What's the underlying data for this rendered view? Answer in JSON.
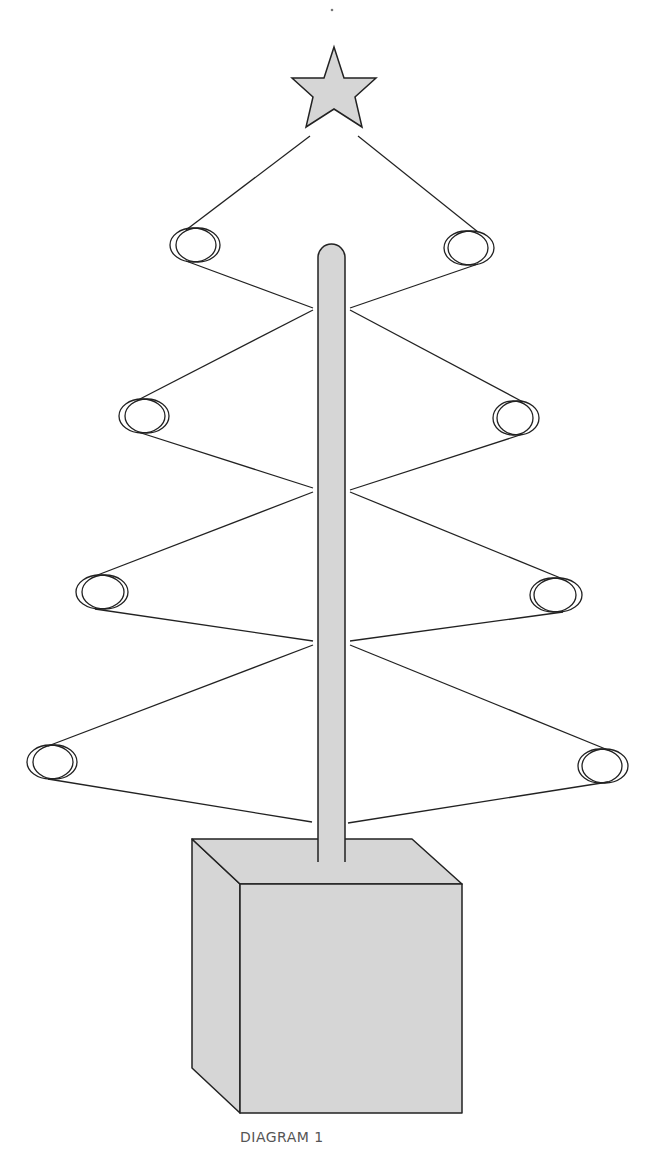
{
  "caption": "DIAGRAM 1",
  "colors": {
    "fill": "#d6d6d6",
    "stroke": "#222222",
    "caption": "#555555",
    "background": "#ffffff"
  },
  "star": {
    "points": [
      [
        334,
        47
      ],
      [
        344,
        78
      ],
      [
        376,
        78
      ],
      [
        355,
        97
      ],
      [
        362,
        127
      ],
      [
        334,
        109
      ],
      [
        306,
        127
      ],
      [
        313,
        97
      ],
      [
        292,
        78
      ],
      [
        324,
        78
      ]
    ]
  },
  "pole": {
    "x": 318,
    "y": 244,
    "width": 27,
    "bottom": 862,
    "radius": 13
  },
  "box": {
    "top_face": [
      [
        192,
        839
      ],
      [
        412,
        839
      ],
      [
        462,
        884
      ],
      [
        240,
        884
      ]
    ],
    "front_face": [
      [
        240,
        884
      ],
      [
        462,
        884
      ],
      [
        462,
        1113
      ],
      [
        240,
        1113
      ]
    ],
    "side_face": [
      [
        192,
        839
      ],
      [
        240,
        884
      ],
      [
        240,
        1113
      ],
      [
        192,
        1068
      ]
    ]
  },
  "rings": [
    {
      "side": "left",
      "cx": 198,
      "cy": 245,
      "rx": 22,
      "ry": 17,
      "tier": 1
    },
    {
      "side": "right",
      "cx": 466,
      "cy": 248,
      "rx": 22,
      "ry": 17,
      "tier": 1
    },
    {
      "side": "left",
      "cx": 147,
      "cy": 416,
      "rx": 22,
      "ry": 17,
      "tier": 2
    },
    {
      "side": "right",
      "cx": 513,
      "cy": 418,
      "rx": 20,
      "ry": 17,
      "tier": 2
    },
    {
      "side": "left",
      "cx": 105,
      "cy": 592,
      "rx": 23,
      "ry": 17,
      "tier": 3
    },
    {
      "side": "right",
      "cx": 553,
      "cy": 595,
      "rx": 23,
      "ry": 17,
      "tier": 3
    },
    {
      "side": "left",
      "cx": 55,
      "cy": 762,
      "rx": 22,
      "ry": 17,
      "tier": 4
    },
    {
      "side": "right",
      "cx": 600,
      "cy": 766,
      "rx": 22,
      "ry": 17,
      "tier": 4
    }
  ],
  "wires": [
    [
      [
        310,
        136
      ],
      [
        186,
        230
      ]
    ],
    [
      [
        358,
        136
      ],
      [
        478,
        232
      ]
    ],
    [
      [
        186,
        261
      ],
      [
        313,
        308
      ]
    ],
    [
      [
        478,
        264
      ],
      [
        350,
        308
      ]
    ],
    [
      [
        313,
        310
      ],
      [
        138,
        400
      ]
    ],
    [
      [
        350,
        310
      ],
      [
        523,
        402
      ]
    ],
    [
      [
        138,
        432
      ],
      [
        313,
        488
      ]
    ],
    [
      [
        523,
        434
      ],
      [
        350,
        490
      ]
    ],
    [
      [
        313,
        492
      ],
      [
        95,
        576
      ]
    ],
    [
      [
        350,
        492
      ],
      [
        563,
        579
      ]
    ],
    [
      [
        95,
        609
      ],
      [
        313,
        641
      ]
    ],
    [
      [
        563,
        612
      ],
      [
        350,
        641
      ]
    ],
    [
      [
        313,
        645
      ],
      [
        48,
        746
      ]
    ],
    [
      [
        350,
        645
      ],
      [
        608,
        750
      ]
    ],
    [
      [
        48,
        779
      ],
      [
        312,
        822
      ]
    ],
    [
      [
        608,
        782
      ],
      [
        348,
        823
      ]
    ]
  ]
}
